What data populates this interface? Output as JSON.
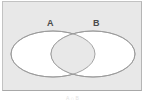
{
  "figure": {
    "type": "venn-diagram",
    "panel": {
      "background_color": "#e8e8e8",
      "border_color": "#c2c2c2"
    },
    "sets": [
      {
        "id": "A",
        "label": "A",
        "fill_color": "#ffffff",
        "outline_color": "#9a9a9a",
        "position": "left"
      },
      {
        "id": "B",
        "label": "B",
        "fill_color": "#ffffff",
        "outline_color": "#9a9a9a",
        "position": "right"
      }
    ],
    "intersection": {
      "shaded": false,
      "fill_color": "#e8e8e8",
      "outline_color": "#9a9a9a"
    },
    "caption": "A ∩ B"
  }
}
